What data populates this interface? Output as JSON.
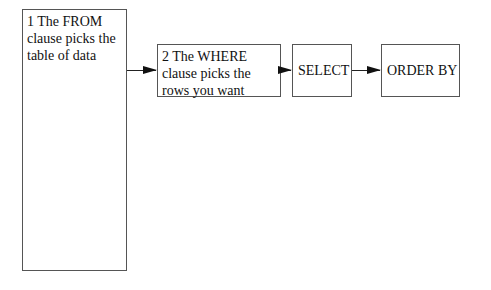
{
  "diagram": {
    "type": "flowchart",
    "direction": "left-to-right",
    "nodes": [
      {
        "id": "from",
        "label": "1 The FROM clause picks the table of data"
      },
      {
        "id": "where",
        "label": "2 The WHERE clause picks the rows you want"
      },
      {
        "id": "select",
        "label": "SELECT"
      },
      {
        "id": "orderby",
        "label": "ORDER BY"
      }
    ],
    "edges": [
      {
        "from": "from",
        "to": "where"
      },
      {
        "from": "where",
        "to": "select"
      },
      {
        "from": "select",
        "to": "orderby"
      }
    ]
  }
}
